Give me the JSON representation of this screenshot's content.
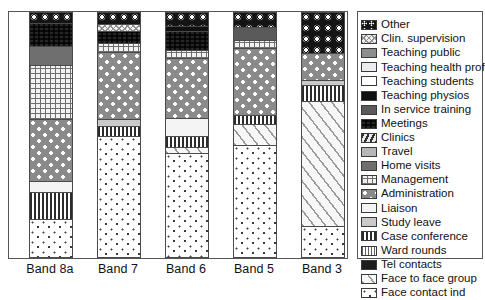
{
  "chart_data": {
    "type": "bar",
    "subtype": "stacked-bar-100pct",
    "title": "",
    "xlabel": "",
    "ylabel": "",
    "grid": false,
    "legend_position": "right",
    "categories": [
      "Band 8a",
      "Band 7",
      "Band 6",
      "Band 5",
      "Band 3"
    ],
    "series": [
      {
        "name": "Other",
        "values": [
          4.0,
          4.5,
          5.5,
          5.5,
          16.5
        ]
      },
      {
        "name": "Clin. supervision",
        "values": [
          0.0,
          3.0,
          0.0,
          0.0,
          0.0
        ]
      },
      {
        "name": "Teaching public",
        "values": [
          0.0,
          0.0,
          0.0,
          0.0,
          0.0
        ]
      },
      {
        "name": "Teaching health prof",
        "values": [
          0.0,
          0.0,
          0.0,
          0.0,
          0.0
        ]
      },
      {
        "name": "Teaching students",
        "values": [
          0.0,
          0.0,
          0.0,
          0.0,
          0.0
        ]
      },
      {
        "name": "Teaching physios",
        "values": [
          0.0,
          0.0,
          2.0,
          1.5,
          0.0
        ]
      },
      {
        "name": "In service training",
        "values": [
          0.0,
          0.0,
          0.0,
          5.5,
          0.0
        ]
      },
      {
        "name": "Meetings",
        "values": [
          9.5,
          5.0,
          7.5,
          0.0,
          0.0
        ]
      },
      {
        "name": "Clinics",
        "values": [
          0.0,
          0.0,
          0.0,
          0.0,
          0.0
        ]
      },
      {
        "name": "Travel",
        "values": [
          0.0,
          0.0,
          0.0,
          0.0,
          0.0
        ]
      },
      {
        "name": "Home visits",
        "values": [
          8.0,
          0.0,
          0.0,
          0.0,
          0.0
        ]
      },
      {
        "name": "Management",
        "values": [
          22.0,
          3.5,
          3.5,
          3.0,
          0.0
        ]
      },
      {
        "name": "Administration",
        "values": [
          25.5,
          27.5,
          24.5,
          27.0,
          11.0
        ]
      },
      {
        "name": "Liaison",
        "values": [
          0.0,
          0.0,
          0.0,
          0.0,
          0.0
        ]
      },
      {
        "name": "Study leave",
        "values": [
          4.5,
          3.0,
          7.5,
          0.0,
          2.0
        ]
      },
      {
        "name": "Case conference",
        "values": [
          11.0,
          4.0,
          4.5,
          4.0,
          6.5
        ]
      },
      {
        "name": "Ward rounds",
        "values": [
          0.0,
          0.0,
          0.0,
          0.0,
          0.0
        ]
      },
      {
        "name": "Tel contacts",
        "values": [
          0.0,
          0.0,
          0.0,
          0.0,
          0.0
        ]
      },
      {
        "name": "Face to face group",
        "values": [
          0.0,
          0.0,
          2.5,
          8.5,
          51.5
        ]
      },
      {
        "name": "Face contact ind",
        "values": [
          15.5,
          49.5,
          42.5,
          45.0,
          12.5
        ]
      }
    ]
  },
  "legend": {
    "items": [
      {
        "label": "Other",
        "pattern": "p-other"
      },
      {
        "label": "Clin. supervision",
        "pattern": "p-clinsup"
      },
      {
        "label": "Teaching public",
        "pattern": "p-tpublic"
      },
      {
        "label": "Teaching health prof",
        "pattern": "p-thealth"
      },
      {
        "label": "Teaching students",
        "pattern": "p-tstudents"
      },
      {
        "label": "Teaching physios",
        "pattern": "p-tphysios"
      },
      {
        "label": "In service training",
        "pattern": "p-inservice"
      },
      {
        "label": "Meetings",
        "pattern": "p-meetings"
      },
      {
        "label": "Clinics",
        "pattern": "p-clinics"
      },
      {
        "label": "Travel",
        "pattern": "p-travel"
      },
      {
        "label": "Home visits",
        "pattern": "p-homevisits"
      },
      {
        "label": "Management",
        "pattern": "p-management"
      },
      {
        "label": "Administration",
        "pattern": "p-administration"
      },
      {
        "label": "Liaison",
        "pattern": "p-liaison"
      },
      {
        "label": "Study leave",
        "pattern": "p-studyleave"
      },
      {
        "label": "Case conference",
        "pattern": "p-caseconf"
      },
      {
        "label": "Ward rounds",
        "pattern": "p-wardrounds"
      },
      {
        "label": "Tel contacts",
        "pattern": "p-telcontacts"
      },
      {
        "label": "Face to face group",
        "pattern": "p-f2fgroup"
      },
      {
        "label": "Face contact ind",
        "pattern": "p-facecontact"
      }
    ]
  },
  "bars": [
    {
      "category": "Band 8a",
      "left": 20,
      "segments": [
        {
          "series": "Other",
          "pct": 4.0,
          "pattern": "p-other"
        },
        {
          "series": "Clin. supervision",
          "pct": 9.5,
          "pattern": "p-meetings"
        },
        {
          "series": "Teaching public",
          "pct": 8.0,
          "pattern": "p-homevisits"
        },
        {
          "series": "Management",
          "pct": 22.0,
          "pattern": "p-management"
        },
        {
          "series": "Administration",
          "pct": 25.5,
          "pattern": "p-administration"
        },
        {
          "series": "Study leave",
          "pct": 4.5,
          "pattern": "p-liaison"
        },
        {
          "series": "Case conference",
          "pct": 11.0,
          "pattern": "p-caseconf"
        },
        {
          "series": "Face contact ind",
          "pct": 15.5,
          "pattern": "p-facecontact"
        }
      ]
    },
    {
      "category": "Band 7",
      "left": 88,
      "segments": [
        {
          "series": "Other",
          "pct": 4.5,
          "pattern": "p-other"
        },
        {
          "series": "Clin. supervision",
          "pct": 3.0,
          "pattern": "p-clinsup"
        },
        {
          "series": "Meetings",
          "pct": 5.0,
          "pattern": "p-meetings"
        },
        {
          "series": "Management",
          "pct": 3.5,
          "pattern": "p-management"
        },
        {
          "series": "Administration",
          "pct": 27.5,
          "pattern": "p-administration"
        },
        {
          "series": "Study leave",
          "pct": 3.0,
          "pattern": "p-studyleave"
        },
        {
          "series": "Case conference",
          "pct": 4.0,
          "pattern": "p-caseconf"
        },
        {
          "series": "Face contact ind",
          "pct": 49.5,
          "pattern": "p-facecontact"
        }
      ]
    },
    {
      "category": "Band 6",
      "left": 156,
      "segments": [
        {
          "series": "Other",
          "pct": 5.5,
          "pattern": "p-other"
        },
        {
          "series": "Teaching physios",
          "pct": 2.0,
          "pattern": "p-tphysios"
        },
        {
          "series": "Meetings",
          "pct": 7.5,
          "pattern": "p-meetings"
        },
        {
          "series": "Management",
          "pct": 3.5,
          "pattern": "p-management"
        },
        {
          "series": "Administration",
          "pct": 24.5,
          "pattern": "p-administration"
        },
        {
          "series": "Study leave",
          "pct": 7.5,
          "pattern": "p-liaison"
        },
        {
          "series": "Case conference",
          "pct": 4.5,
          "pattern": "p-caseconf"
        },
        {
          "series": "Face to face group",
          "pct": 2.5,
          "pattern": "p-f2fgroup"
        },
        {
          "series": "Face contact ind",
          "pct": 42.5,
          "pattern": "p-facecontact"
        }
      ]
    },
    {
      "category": "Band 5",
      "left": 224,
      "segments": [
        {
          "series": "Other",
          "pct": 5.5,
          "pattern": "p-other"
        },
        {
          "series": "In service training",
          "pct": 5.5,
          "pattern": "p-inservice"
        },
        {
          "series": "Management",
          "pct": 3.0,
          "pattern": "p-management"
        },
        {
          "series": "Administration",
          "pct": 27.0,
          "pattern": "p-administration"
        },
        {
          "series": "Case conference",
          "pct": 4.0,
          "pattern": "p-caseconf"
        },
        {
          "series": "Face to face group",
          "pct": 8.5,
          "pattern": "p-f2fgroup"
        },
        {
          "series": "Face contact ind",
          "pct": 45.0,
          "pattern": "p-facecontact"
        }
      ]
    },
    {
      "category": "Band 3",
      "left": 292,
      "segments": [
        {
          "series": "Other",
          "pct": 16.5,
          "pattern": "p-other"
        },
        {
          "series": "Administration",
          "pct": 11.0,
          "pattern": "p-administration"
        },
        {
          "series": "Study leave",
          "pct": 2.0,
          "pattern": "p-studyleave"
        },
        {
          "series": "Case conference",
          "pct": 6.5,
          "pattern": "p-caseconf"
        },
        {
          "series": "Face to face group",
          "pct": 51.5,
          "pattern": "p-f2fgroup"
        },
        {
          "series": "Face contact ind",
          "pct": 12.5,
          "pattern": "p-facecontact"
        }
      ]
    }
  ],
  "xaxis": {
    "ticks": [
      {
        "label": "Band 8a",
        "left": 7
      },
      {
        "label": "Band 7",
        "left": 75
      },
      {
        "label": "Band 6",
        "left": 143
      },
      {
        "label": "Band 5",
        "left": 211
      },
      {
        "label": "Band 3",
        "left": 279
      }
    ]
  }
}
